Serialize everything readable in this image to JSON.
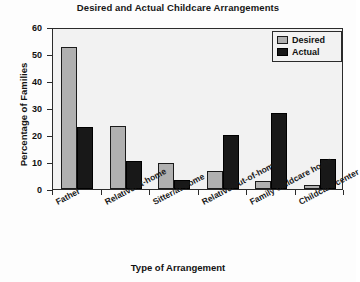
{
  "chart_data": {
    "type": "bar",
    "title": "Desired and Actual Childcare Arrangements",
    "xlabel": "Type of Arrangement",
    "ylabel": "Percentage of Families",
    "categories": [
      "Father",
      "Relative/at-home",
      "Sitter/at-home",
      "Relative/out-of-home",
      "Family childcare home",
      "Childcare center"
    ],
    "series": [
      {
        "name": "Desired",
        "color": "#b0b0b0",
        "values": [
          52.5,
          23.5,
          9.5,
          6.5,
          3,
          1.5
        ]
      },
      {
        "name": "Actual",
        "color": "#181818",
        "values": [
          23,
          10.5,
          3.5,
          20,
          28,
          11
        ]
      }
    ],
    "ylim": [
      0,
      60
    ],
    "yticks": [
      0,
      10,
      20,
      30,
      40,
      50,
      60
    ],
    "ytick_labels": [
      "0",
      "10",
      "20",
      "30",
      "40",
      "50",
      "60"
    ],
    "grid": false,
    "legend_position": "top-right"
  }
}
